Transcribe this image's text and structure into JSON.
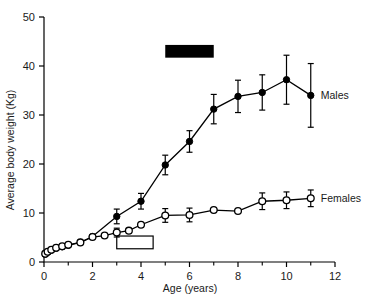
{
  "chart_data": {
    "type": "line",
    "title": "",
    "xlabel": "Age (years)",
    "ylabel": "Average body weight (Kg)",
    "xlim": [
      0,
      12
    ],
    "ylim": [
      0,
      50
    ],
    "xticks": [
      0,
      2,
      4,
      6,
      8,
      10,
      12
    ],
    "xtick_labels": [
      "0",
      "2",
      "4",
      "6",
      "8",
      "10",
      "12"
    ],
    "xminorticks": [
      1,
      3,
      5,
      7,
      9,
      11
    ],
    "yticks": [
      0,
      10,
      20,
      30,
      40,
      50
    ],
    "ytick_labels": [
      "0",
      "10",
      "20",
      "30",
      "40",
      "50"
    ],
    "grid": false,
    "legend_position": "right-inline",
    "series": [
      {
        "name": "Males",
        "marker": "filled-circle",
        "x": [
          0.05,
          0.15,
          0.3,
          0.5,
          0.75,
          1.0,
          1.5,
          2.0,
          3.0,
          4.0,
          5.0,
          6.0,
          7.0,
          8.0,
          9.0,
          10.0,
          11.0
        ],
        "values": [
          1.6,
          2.0,
          2.4,
          2.8,
          3.1,
          3.4,
          4.0,
          5.2,
          9.3,
          12.4,
          19.8,
          24.6,
          31.2,
          33.8,
          34.6,
          37.2,
          34.0
        ],
        "errors": [
          0.5,
          0.5,
          0.5,
          0.5,
          0.5,
          0.5,
          0.5,
          0.6,
          1.5,
          1.6,
          2.0,
          2.2,
          3.0,
          3.3,
          3.6,
          5.0,
          6.5
        ]
      },
      {
        "name": "Females",
        "marker": "open-circle",
        "x": [
          0.05,
          0.15,
          0.3,
          0.5,
          0.75,
          1.0,
          1.5,
          2.0,
          2.5,
          3.0,
          3.5,
          4.0,
          5.0,
          6.0,
          7.0,
          8.0,
          9.0,
          10.0,
          11.0
        ],
        "values": [
          1.7,
          2.1,
          2.5,
          2.9,
          3.2,
          3.5,
          4.0,
          5.1,
          5.4,
          6.0,
          6.4,
          7.6,
          9.5,
          9.6,
          10.6,
          10.4,
          12.4,
          12.6,
          13.0
        ],
        "errors": [
          0.4,
          0.4,
          0.4,
          0.4,
          0.4,
          0.4,
          0.4,
          0.4,
          0.4,
          0.9,
          0.4,
          0.6,
          1.4,
          1.4,
          0.4,
          0.4,
          1.7,
          1.7,
          1.7
        ]
      }
    ],
    "annotations": [
      {
        "name": "male-maturity-bar",
        "style": "filled",
        "x_start": 5.0,
        "x_end": 7.0,
        "y": 43.0,
        "height": 2.6
      },
      {
        "name": "female-maturity-bar",
        "style": "open",
        "x_start": 3.0,
        "x_end": 4.5,
        "y": 4.0,
        "height": 2.6
      }
    ],
    "series_labels": {
      "males": "Males",
      "females": "Females"
    }
  }
}
